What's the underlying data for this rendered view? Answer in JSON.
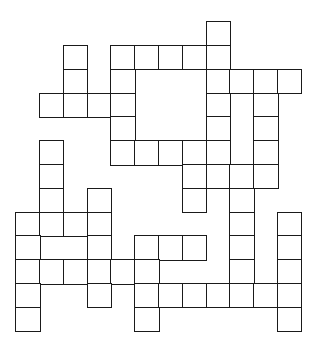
{
  "puzzle": {
    "type": "crossword-grid",
    "origin_x": 16,
    "origin_y": 22,
    "cell_size": 23.8,
    "line_color": "#1a1a1a",
    "cell_fill": "#ffffff",
    "rows": [
      {
        "r": 0,
        "cols": [
          8
        ]
      },
      {
        "r": 1,
        "cols": [
          2,
          4,
          5,
          6,
          7,
          8
        ]
      },
      {
        "r": 2,
        "cols": [
          2,
          4,
          8,
          9,
          10,
          11
        ]
      },
      {
        "r": 3,
        "cols": [
          1,
          2,
          3,
          4,
          8,
          10
        ]
      },
      {
        "r": 4,
        "cols": [
          4,
          8,
          10
        ]
      },
      {
        "r": 5,
        "cols": [
          1,
          4,
          5,
          6,
          7,
          8,
          10
        ]
      },
      {
        "r": 6,
        "cols": [
          1,
          7,
          8,
          9,
          10
        ]
      },
      {
        "r": 7,
        "cols": [
          1,
          3,
          7,
          9
        ]
      },
      {
        "r": 8,
        "cols": [
          0,
          1,
          2,
          3,
          9,
          11
        ]
      },
      {
        "r": 9,
        "cols": [
          0,
          3,
          5,
          6,
          7,
          9,
          11
        ]
      },
      {
        "r": 10,
        "cols": [
          0,
          1,
          2,
          3,
          4,
          5,
          9,
          11
        ]
      },
      {
        "r": 11,
        "cols": [
          0,
          3,
          5,
          6,
          7,
          8,
          9,
          10,
          11
        ]
      },
      {
        "r": 12,
        "cols": [
          0,
          5,
          11
        ]
      }
    ]
  }
}
